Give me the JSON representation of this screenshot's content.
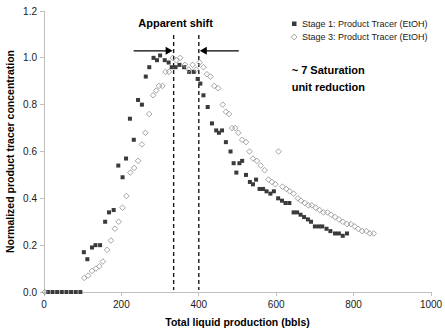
{
  "chart_data": {
    "type": "scatter",
    "title": "",
    "xlabel": "Total liquid production (bbls)",
    "ylabel": "Normalized product tracer concentration",
    "xlim": [
      0,
      1000
    ],
    "ylim": [
      0,
      1.2
    ],
    "xticks": [
      0,
      200,
      400,
      600,
      800,
      1000
    ],
    "xtick_labels": [
      "0",
      "200",
      "400",
      "600",
      "800",
      "1000"
    ],
    "yticks": [
      0.0,
      0.2,
      0.4,
      0.6,
      0.8,
      1.0,
      1.2
    ],
    "ytick_labels": [
      "0.0",
      "0.2",
      "0.4",
      "0.6",
      "0.8",
      "1.0",
      "1.2"
    ],
    "grid": false,
    "legend_position": "top-right",
    "series": [
      {
        "name": "Stage 1: Product Tracer (EtOH)",
        "marker": "filled-square",
        "color": "#3a3a3a",
        "points": [
          [
            10,
            0.0
          ],
          [
            22,
            0.0
          ],
          [
            34,
            0.0
          ],
          [
            46,
            0.0
          ],
          [
            58,
            0.0
          ],
          [
            70,
            0.0
          ],
          [
            82,
            0.0
          ],
          [
            94,
            0.0
          ],
          [
            103,
            0.17
          ],
          [
            112,
            0.14
          ],
          [
            124,
            0.19
          ],
          [
            133,
            0.2
          ],
          [
            145,
            0.2
          ],
          [
            158,
            0.3
          ],
          [
            168,
            0.34
          ],
          [
            180,
            0.35
          ],
          [
            192,
            0.54
          ],
          [
            203,
            0.49
          ],
          [
            212,
            0.57
          ],
          [
            222,
            0.74
          ],
          [
            232,
            0.65
          ],
          [
            243,
            0.82
          ],
          [
            253,
            0.8
          ],
          [
            263,
            0.92
          ],
          [
            272,
            0.96
          ],
          [
            283,
            1.0
          ],
          [
            292,
            0.99
          ],
          [
            300,
            1.01
          ],
          [
            312,
            0.99
          ],
          [
            322,
            0.98
          ],
          [
            330,
            0.96
          ],
          [
            340,
            0.96
          ],
          [
            350,
            0.97
          ],
          [
            362,
            0.96
          ],
          [
            375,
            0.94
          ],
          [
            387,
            0.94
          ],
          [
            397,
            0.91
          ],
          [
            404,
            0.89
          ],
          [
            412,
            0.84
          ],
          [
            423,
            0.79
          ],
          [
            434,
            0.72
          ],
          [
            445,
            0.69
          ],
          [
            452,
            0.68
          ],
          [
            460,
            0.69
          ],
          [
            470,
            0.64
          ],
          [
            482,
            0.6
          ],
          [
            490,
            0.55
          ],
          [
            497,
            0.51
          ],
          [
            505,
            0.55
          ],
          [
            512,
            0.56
          ],
          [
            522,
            0.5
          ],
          [
            532,
            0.47
          ],
          [
            540,
            0.46
          ],
          [
            548,
            0.48
          ],
          [
            557,
            0.44
          ],
          [
            566,
            0.44
          ],
          [
            575,
            0.43
          ],
          [
            585,
            0.42
          ],
          [
            594,
            0.43
          ],
          [
            605,
            0.4
          ],
          [
            615,
            0.39
          ],
          [
            624,
            0.38
          ],
          [
            634,
            0.38
          ],
          [
            645,
            0.34
          ],
          [
            654,
            0.34
          ],
          [
            663,
            0.33
          ],
          [
            672,
            0.32
          ],
          [
            682,
            0.31
          ],
          [
            690,
            0.3
          ],
          [
            700,
            0.28
          ],
          [
            710,
            0.28
          ],
          [
            719,
            0.28
          ],
          [
            730,
            0.27
          ],
          [
            740,
            0.26
          ],
          [
            752,
            0.25
          ],
          [
            762,
            0.25
          ],
          [
            772,
            0.24
          ],
          [
            783,
            0.25
          ]
        ]
      },
      {
        "name": "Stage 3: Product Tracer (EtOH)",
        "marker": "open-diamond",
        "color": "#9a9a9a",
        "points": [
          [
            2,
            0.0
          ],
          [
            104,
            0.06
          ],
          [
            114,
            0.07
          ],
          [
            124,
            0.09
          ],
          [
            134,
            0.1
          ],
          [
            143,
            0.11
          ],
          [
            152,
            0.13
          ],
          [
            163,
            0.18
          ],
          [
            173,
            0.22
          ],
          [
            183,
            0.27
          ],
          [
            193,
            0.3
          ],
          [
            203,
            0.36
          ],
          [
            213,
            0.41
          ],
          [
            223,
            0.51
          ],
          [
            233,
            0.53
          ],
          [
            243,
            0.56
          ],
          [
            253,
            0.63
          ],
          [
            262,
            0.68
          ],
          [
            272,
            0.76
          ],
          [
            282,
            0.84
          ],
          [
            290,
            0.86
          ],
          [
            297,
            0.88
          ],
          [
            306,
            0.88
          ],
          [
            314,
            0.94
          ],
          [
            323,
            0.94
          ],
          [
            333,
            1.0
          ],
          [
            342,
            0.99
          ],
          [
            352,
            1.0
          ],
          [
            364,
            0.97
          ],
          [
            374,
            0.95
          ],
          [
            384,
            0.97
          ],
          [
            393,
            0.95
          ],
          [
            402,
            0.98
          ],
          [
            412,
            0.96
          ],
          [
            421,
            0.93
          ],
          [
            430,
            0.92
          ],
          [
            440,
            0.88
          ],
          [
            450,
            0.87
          ],
          [
            462,
            0.8
          ],
          [
            470,
            0.77
          ],
          [
            478,
            0.76
          ],
          [
            486,
            0.7
          ],
          [
            494,
            0.7
          ],
          [
            502,
            0.68
          ],
          [
            512,
            0.65
          ],
          [
            522,
            0.64
          ],
          [
            531,
            0.6
          ],
          [
            540,
            0.57
          ],
          [
            550,
            0.56
          ],
          [
            560,
            0.54
          ],
          [
            570,
            0.52
          ],
          [
            580,
            0.48
          ],
          [
            589,
            0.47
          ],
          [
            598,
            0.46
          ],
          [
            606,
            0.6
          ],
          [
            616,
            0.45
          ],
          [
            626,
            0.44
          ],
          [
            635,
            0.43
          ],
          [
            645,
            0.42
          ],
          [
            656,
            0.4
          ],
          [
            664,
            0.39
          ],
          [
            674,
            0.38
          ],
          [
            683,
            0.37
          ],
          [
            692,
            0.37
          ],
          [
            702,
            0.36
          ],
          [
            712,
            0.35
          ],
          [
            722,
            0.34
          ],
          [
            732,
            0.34
          ],
          [
            742,
            0.33
          ],
          [
            752,
            0.32
          ],
          [
            762,
            0.31
          ],
          [
            772,
            0.3
          ],
          [
            783,
            0.29
          ],
          [
            793,
            0.29
          ],
          [
            803,
            0.28
          ],
          [
            812,
            0.27
          ],
          [
            822,
            0.26
          ],
          [
            833,
            0.26
          ],
          [
            842,
            0.25
          ],
          [
            852,
            0.25
          ]
        ]
      }
    ],
    "annotations": [
      {
        "id": "apparent-shift",
        "text": "Apparent shift",
        "x": 340,
        "y": 1.13
      },
      {
        "id": "saturation-note",
        "text": "~ 7 Saturation",
        "x": 640,
        "y": 0.93
      },
      {
        "id": "saturation-note-2",
        "text": "unit reduction",
        "x": 640,
        "y": 0.86
      }
    ],
    "shift_markers": {
      "line_1_x": 335,
      "line_2_x": 400,
      "arrow_y": 1.03
    }
  },
  "legend": {
    "items": [
      {
        "label": "Stage 1: Product Tracer (EtOH)",
        "marker": "filled-square",
        "color": "#3a3a3a"
      },
      {
        "label": "Stage 3: Product Tracer (EtOH)",
        "marker": "open-diamond",
        "color": "#9a9a9a"
      }
    ]
  }
}
